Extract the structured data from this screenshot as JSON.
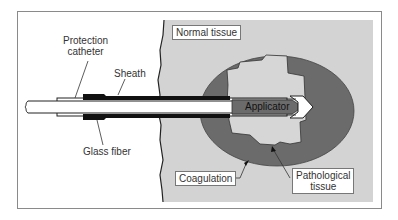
{
  "diagram": {
    "colors": {
      "frame": "#888888",
      "normal_tissue": "#d3d3d3",
      "coagulation": "#6b6b6b",
      "pathological_tissue": "#d3d3d3",
      "sheath": "#111111",
      "applicator": "#6b6b6b",
      "fiber": "#ffffff"
    },
    "labels": {
      "protection_catheter_line1": "Protection",
      "protection_catheter_line2": "catheter",
      "sheath": "Sheath",
      "glass_fiber": "Glass fiber",
      "normal_tissue": "Normal tissue",
      "applicator": "Applicator",
      "coagulation": "Coagulation",
      "pathological_tissue_line1": "Pathological",
      "pathological_tissue_line2": "tissue"
    }
  }
}
